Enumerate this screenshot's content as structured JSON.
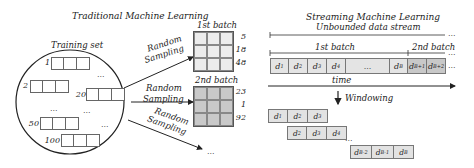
{
  "traditional": {
    "title": "Traditional Machine Learning",
    "training_set_label": "Training set",
    "samples": [
      {
        "id": "1"
      },
      {
        "id": "2"
      },
      {
        "id": "20"
      },
      {
        "id": "50"
      },
      {
        "id": "100"
      }
    ],
    "ellipsis": "...",
    "sampling_label_line1": "Random",
    "sampling_label_line2": "Sampling",
    "batches": [
      {
        "label": "1st batch",
        "indices": [
          "5",
          "18",
          "48"
        ]
      },
      {
        "label": "2nd batch",
        "indices": [
          "23",
          "1",
          "92"
        ]
      }
    ],
    "more": "..."
  },
  "streaming": {
    "title": "Streaming Machine Learning",
    "stream_label": "Unbounded data stream",
    "batch1_label": "1st batch",
    "batch2_label": "2nd batch",
    "time_label": "time",
    "windowing_label": "Windowing",
    "ellipsis": "...",
    "stream_cells": [
      {
        "base": "d",
        "sub": "1"
      },
      {
        "base": "d",
        "sub": "2"
      },
      {
        "base": "d",
        "sub": "3"
      },
      {
        "base": "d",
        "sub": "4"
      },
      {
        "base": "...",
        "sub": ""
      },
      {
        "base": "d",
        "sub": "B"
      },
      {
        "base": "d",
        "sub": "B+1"
      },
      {
        "base": "d",
        "sub": "B+2"
      }
    ],
    "windows": [
      [
        {
          "base": "d",
          "sub": "1"
        },
        {
          "base": "d",
          "sub": "2"
        },
        {
          "base": "d",
          "sub": "3"
        }
      ],
      [
        {
          "base": "d",
          "sub": "2"
        },
        {
          "base": "d",
          "sub": "3"
        },
        {
          "base": "d",
          "sub": "4"
        }
      ],
      [
        {
          "base": "d",
          "sub": "B-2"
        },
        {
          "base": "d",
          "sub": "B-1"
        },
        {
          "base": "d",
          "sub": "B"
        }
      ]
    ]
  }
}
